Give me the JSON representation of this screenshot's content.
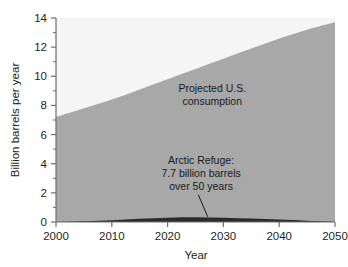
{
  "chart_data": {
    "type": "area",
    "title": "",
    "xlabel": "Year",
    "ylabel": "Billion barrels per year",
    "xlim": [
      2000,
      2050
    ],
    "ylim": [
      0,
      14
    ],
    "grid": false,
    "legend_position": "none",
    "x_tick_labels": [
      "2000",
      "2010",
      "2020",
      "2030",
      "2040",
      "2050"
    ],
    "x_ticks": [
      2000,
      2010,
      2020,
      2030,
      2040,
      2050
    ],
    "y_tick_labels": [
      "0",
      "2",
      "4",
      "6",
      "8",
      "10",
      "12",
      "14"
    ],
    "y_ticks": [
      0,
      2,
      4,
      6,
      8,
      10,
      12,
      14
    ],
    "y_minor_ticks": [
      1,
      3,
      5,
      7,
      9,
      11,
      13
    ],
    "x": [
      2000,
      2005,
      2010,
      2015,
      2020,
      2025,
      2030,
      2035,
      2040,
      2045,
      2050
    ],
    "series": [
      {
        "name": "Projected U.S. consumption",
        "color": "#a8a8a8",
        "values": [
          7.2,
          7.8,
          8.4,
          9.1,
          9.8,
          10.5,
          11.2,
          11.9,
          12.6,
          13.2,
          13.7
        ]
      },
      {
        "name": "Arctic Refuge",
        "color": "#2a2a2a",
        "values": [
          0.0,
          0.05,
          0.12,
          0.22,
          0.3,
          0.33,
          0.3,
          0.24,
          0.17,
          0.09,
          0.02
        ]
      }
    ],
    "annotations": [
      {
        "id": "projected-consumption",
        "lines": [
          "Projected U.S.",
          "consumption"
        ],
        "x": 2028,
        "y": 8.9
      },
      {
        "id": "arctic-refuge",
        "lines": [
          "Arctic Refuge:",
          "7.7 billion barrels",
          "over 50 years"
        ],
        "x": 2026,
        "y": 4.0,
        "leader_line": true
      }
    ],
    "colors": {
      "plot_background": "#f5f5f5",
      "consumption_fill": "#a8a8a8",
      "refuge_fill": "#2a2a2a",
      "axis": "#6e6e6e",
      "text": "#231f20"
    }
  }
}
